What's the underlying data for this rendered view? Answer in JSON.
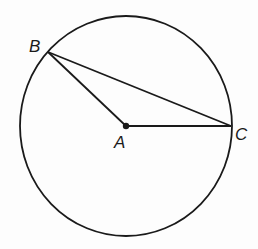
{
  "diagram": {
    "type": "circle-geometry",
    "circle": {
      "center": "A",
      "cx": 126,
      "cy": 126,
      "rx": 106,
      "ry": 110
    },
    "points": [
      {
        "name": "A",
        "x": 126,
        "y": 126,
        "role": "center"
      },
      {
        "name": "B",
        "x": 48,
        "y": 52,
        "role": "on-circle"
      },
      {
        "name": "C",
        "x": 231,
        "y": 126,
        "role": "on-circle"
      }
    ],
    "segments": [
      "AB",
      "BC",
      "AC"
    ],
    "labels": {
      "A": "A",
      "B": "B",
      "C": "C"
    },
    "colors": {
      "stroke": "#1a1a1a",
      "background": "#fdfdfd"
    }
  }
}
